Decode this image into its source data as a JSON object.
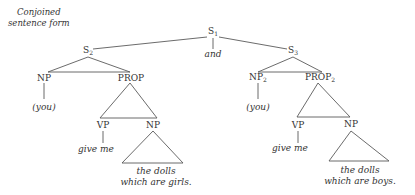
{
  "caption": {
    "line1": "Conjoined",
    "line2": "sentence form"
  },
  "nodes": {
    "s1": {
      "label": "S",
      "sub": "1"
    },
    "and": {
      "label": "and"
    },
    "s2": {
      "label": "S",
      "sub": "2"
    },
    "s3": {
      "label": "S",
      "sub": "3"
    },
    "np_left": {
      "label": "NP"
    },
    "prop_left": {
      "label": "PROP"
    },
    "np2_right": {
      "label": "NP",
      "sub": "2"
    },
    "prop2_right": {
      "label": "PROP",
      "sub": "2"
    },
    "you_left": {
      "label": "(you)"
    },
    "you_right": {
      "label": "(you)"
    },
    "vp_left": {
      "label": "VP"
    },
    "np_obj_left": {
      "label": "NP"
    },
    "vp_right": {
      "label": "VP"
    },
    "np_obj_right": {
      "label": "NP"
    },
    "give_left": {
      "label": "give me"
    },
    "give_right": {
      "label": "give me"
    },
    "dolls_left": {
      "line1": "the dolls",
      "line2": "which are girls."
    },
    "dolls_right": {
      "line1": "the dolls",
      "line2": "which are boys."
    }
  },
  "colors": {
    "line": "#555555",
    "text": "#333333"
  }
}
